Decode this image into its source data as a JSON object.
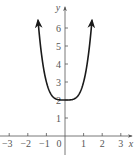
{
  "chart_data": {
    "type": "line",
    "title": "",
    "xlabel": "x",
    "ylabel": "y",
    "xlim": [
      -3.5,
      3.5
    ],
    "ylim": [
      -0.8,
      6.9
    ],
    "x_ticks": [
      -3,
      -2,
      -1,
      1,
      2,
      3
    ],
    "x_tick_labels": [
      "−3",
      "−2",
      "−1",
      "1",
      "2",
      "3"
    ],
    "y_ticks": [
      1,
      2,
      3,
      4,
      5,
      6
    ],
    "y_tick_labels": [
      "1",
      "2",
      "3",
      "4",
      "5",
      "6"
    ],
    "origin_label": "0",
    "grid": false,
    "legend": null,
    "series": [
      {
        "name": "y = x^4 + 2",
        "x": [
          -1.45,
          -1.25,
          -1.0,
          -0.75,
          -0.5,
          -0.25,
          0,
          0.25,
          0.5,
          0.75,
          1.0,
          1.25,
          1.45
        ],
        "y": [
          6.42,
          4.44,
          3.0,
          2.32,
          2.06,
          2.0,
          2.0,
          2.0,
          2.06,
          2.32,
          3.0,
          4.44,
          6.42
        ],
        "end_arrows": true
      }
    ],
    "colors": {
      "curve": "#1a1a1a",
      "axes": "#555555"
    }
  }
}
